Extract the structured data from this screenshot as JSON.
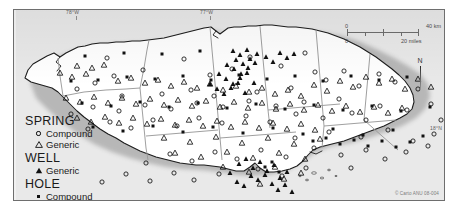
{
  "map": {
    "title": "Jamaica water-source place names",
    "background_color": "#e9e9e9",
    "frame_color": "#6e6e6e",
    "land_color": "#ffffff",
    "parish_border_color": "#8f8f8f",
    "coast_color": "#1a1a1a"
  },
  "graticule": {
    "longitude_labels": [
      {
        "text": "78°W",
        "x": 66,
        "y": 9
      },
      {
        "text": "77°W",
        "x": 200,
        "y": 9
      }
    ],
    "latitude_labels": [
      {
        "text": "18°N",
        "x": 433,
        "y": 124
      }
    ]
  },
  "legend": {
    "groups": [
      {
        "heading": "SPRING",
        "items": [
          {
            "symbol": "circle-open",
            "label": "Compound"
          },
          {
            "symbol": "triangle-open",
            "label": "Generic"
          }
        ]
      },
      {
        "heading": "WELL",
        "items": [
          {
            "symbol": "triangle-filled",
            "label": "Generic"
          }
        ]
      },
      {
        "heading": "HOLE",
        "items": [
          {
            "symbol": "square-filled",
            "label": "Compound"
          }
        ]
      }
    ]
  },
  "scalebar": {
    "km": {
      "zero": "0",
      "max": "40 km"
    },
    "miles": {
      "zero": "0",
      "max": "20 miles"
    }
  },
  "compass": {
    "north_label": "N"
  },
  "credit": {
    "text": "© Carto ANU 08-004"
  },
  "symbols": {
    "spring_compound": [
      [
        93,
        48
      ],
      [
        170,
        49
      ],
      [
        236,
        47
      ],
      [
        291,
        43
      ],
      [
        330,
        61
      ],
      [
        365,
        64
      ],
      [
        301,
        62
      ],
      [
        267,
        56
      ],
      [
        218,
        59
      ],
      [
        196,
        65
      ],
      [
        129,
        60
      ],
      [
        100,
        66
      ],
      [
        81,
        73
      ],
      [
        63,
        79
      ],
      [
        108,
        86
      ],
      [
        148,
        84
      ],
      [
        177,
        80
      ],
      [
        200,
        86
      ],
      [
        243,
        82
      ],
      [
        277,
        78
      ],
      [
        312,
        70
      ],
      [
        345,
        76
      ],
      [
        381,
        72
      ],
      [
        404,
        79
      ],
      [
        417,
        94
      ],
      [
        393,
        100
      ],
      [
        366,
        96
      ],
      [
        338,
        103
      ],
      [
        309,
        108
      ],
      [
        282,
        104
      ],
      [
        256,
        112
      ],
      [
        232,
        106
      ],
      [
        208,
        113
      ],
      [
        185,
        108
      ],
      [
        163,
        116
      ],
      [
        139,
        110
      ],
      [
        117,
        118
      ],
      [
        96,
        112
      ],
      [
        74,
        119
      ],
      [
        281,
        128
      ],
      [
        315,
        122
      ],
      [
        347,
        127
      ],
      [
        374,
        120
      ],
      [
        399,
        131
      ],
      [
        420,
        124
      ],
      [
        352,
        140
      ],
      [
        327,
        145
      ],
      [
        300,
        138
      ],
      [
        272,
        147
      ],
      [
        247,
        140
      ],
      [
        223,
        149
      ],
      [
        201,
        142
      ],
      [
        178,
        151
      ],
      [
        156,
        144
      ],
      [
        132,
        153
      ],
      [
        244,
        159
      ],
      [
        268,
        166
      ],
      [
        292,
        158
      ],
      [
        160,
        163
      ],
      [
        136,
        171
      ],
      [
        112,
        164
      ],
      [
        88,
        172
      ],
      [
        180,
        170
      ],
      [
        205,
        164
      ],
      [
        392,
        142
      ],
      [
        414,
        136
      ],
      [
        371,
        149
      ],
      [
        337,
        158
      ],
      [
        427,
        110
      ],
      [
        352,
        110
      ],
      [
        325,
        89
      ],
      [
        290,
        92
      ],
      [
        262,
        96
      ],
      [
        235,
        91
      ],
      [
        209,
        97
      ],
      [
        183,
        93
      ],
      [
        157,
        99
      ],
      [
        131,
        95
      ],
      [
        105,
        101
      ],
      [
        79,
        97
      ],
      [
        57,
        104
      ]
    ],
    "spring_generic": [
      [
        63,
        56
      ],
      [
        78,
        58
      ],
      [
        90,
        55
      ],
      [
        46,
        63
      ],
      [
        58,
        67
      ],
      [
        72,
        64
      ],
      [
        104,
        71
      ],
      [
        117,
        68
      ],
      [
        131,
        73
      ],
      [
        144,
        70
      ],
      [
        157,
        76
      ],
      [
        170,
        72
      ],
      [
        183,
        78
      ],
      [
        196,
        74
      ],
      [
        209,
        80
      ],
      [
        222,
        76
      ],
      [
        235,
        82
      ],
      [
        248,
        78
      ],
      [
        261,
        84
      ],
      [
        274,
        80
      ],
      [
        287,
        86
      ],
      [
        300,
        75
      ],
      [
        313,
        81
      ],
      [
        326,
        71
      ],
      [
        339,
        77
      ],
      [
        352,
        67
      ],
      [
        365,
        73
      ],
      [
        378,
        69
      ],
      [
        391,
        79
      ],
      [
        404,
        69
      ],
      [
        417,
        77
      ],
      [
        52,
        88
      ],
      [
        66,
        92
      ],
      [
        80,
        87
      ],
      [
        94,
        93
      ],
      [
        108,
        88
      ],
      [
        122,
        94
      ],
      [
        136,
        89
      ],
      [
        150,
        95
      ],
      [
        164,
        90
      ],
      [
        178,
        96
      ],
      [
        192,
        91
      ],
      [
        206,
        97
      ],
      [
        220,
        92
      ],
      [
        234,
        98
      ],
      [
        248,
        93
      ],
      [
        262,
        99
      ],
      [
        276,
        94
      ],
      [
        290,
        100
      ],
      [
        304,
        95
      ],
      [
        318,
        101
      ],
      [
        332,
        96
      ],
      [
        346,
        102
      ],
      [
        360,
        97
      ],
      [
        374,
        103
      ],
      [
        388,
        98
      ],
      [
        63,
        108
      ],
      [
        77,
        112
      ],
      [
        91,
        107
      ],
      [
        105,
        113
      ],
      [
        119,
        108
      ],
      [
        133,
        114
      ],
      [
        147,
        109
      ],
      [
        161,
        115
      ],
      [
        175,
        110
      ],
      [
        189,
        116
      ],
      [
        203,
        111
      ],
      [
        217,
        117
      ],
      [
        231,
        112
      ],
      [
        245,
        118
      ],
      [
        259,
        113
      ],
      [
        273,
        119
      ],
      [
        287,
        114
      ],
      [
        301,
        120
      ],
      [
        150,
        128
      ],
      [
        176,
        132
      ],
      [
        202,
        127
      ],
      [
        228,
        133
      ],
      [
        254,
        128
      ],
      [
        280,
        134
      ],
      [
        306,
        129
      ],
      [
        161,
        143
      ],
      [
        187,
        147
      ],
      [
        213,
        142
      ],
      [
        239,
        148
      ],
      [
        265,
        143
      ],
      [
        291,
        149
      ],
      [
        209,
        157
      ],
      [
        235,
        162
      ],
      [
        261,
        157
      ],
      [
        287,
        163
      ],
      [
        246,
        174
      ],
      [
        270,
        169
      ]
    ],
    "well_generic": [
      [
        219,
        41
      ],
      [
        226,
        45
      ],
      [
        233,
        40
      ],
      [
        222,
        50
      ],
      [
        229,
        54
      ],
      [
        236,
        49
      ],
      [
        243,
        44
      ],
      [
        213,
        55
      ],
      [
        220,
        59
      ],
      [
        227,
        64
      ],
      [
        234,
        58
      ],
      [
        241,
        53
      ],
      [
        205,
        64
      ],
      [
        212,
        69
      ],
      [
        219,
        74
      ],
      [
        226,
        68
      ],
      [
        233,
        63
      ],
      [
        240,
        73
      ],
      [
        196,
        74
      ],
      [
        203,
        79
      ],
      [
        210,
        84
      ],
      [
        217,
        78
      ],
      [
        224,
        73
      ],
      [
        231,
        83
      ],
      [
        252,
        47
      ],
      [
        259,
        52
      ],
      [
        266,
        43
      ],
      [
        273,
        48
      ],
      [
        280,
        44
      ],
      [
        225,
        154
      ],
      [
        232,
        149
      ],
      [
        239,
        158
      ],
      [
        246,
        152
      ],
      [
        253,
        161
      ],
      [
        260,
        155
      ],
      [
        237,
        166
      ],
      [
        244,
        170
      ],
      [
        251,
        165
      ],
      [
        258,
        174
      ],
      [
        266,
        168
      ],
      [
        273,
        162
      ],
      [
        216,
        163
      ],
      [
        223,
        172
      ],
      [
        230,
        176
      ],
      [
        264,
        180
      ],
      [
        271,
        175
      ],
      [
        278,
        182
      ]
    ],
    "hole_compound": [
      [
        71,
        46
      ],
      [
        110,
        43
      ],
      [
        148,
        44
      ],
      [
        186,
        41
      ],
      [
        57,
        71
      ],
      [
        84,
        70
      ],
      [
        113,
        67
      ],
      [
        141,
        69
      ],
      [
        169,
        66
      ],
      [
        197,
        70
      ],
      [
        225,
        65
      ],
      [
        253,
        69
      ],
      [
        281,
        66
      ],
      [
        309,
        71
      ],
      [
        337,
        66
      ],
      [
        365,
        70
      ],
      [
        393,
        67
      ],
      [
        68,
        93
      ],
      [
        97,
        96
      ],
      [
        126,
        92
      ],
      [
        155,
        97
      ],
      [
        184,
        93
      ],
      [
        213,
        98
      ],
      [
        242,
        94
      ],
      [
        271,
        99
      ],
      [
        300,
        95
      ],
      [
        329,
        100
      ],
      [
        358,
        96
      ],
      [
        387,
        101
      ],
      [
        416,
        97
      ],
      [
        79,
        117
      ],
      [
        109,
        121
      ],
      [
        139,
        116
      ],
      [
        169,
        122
      ],
      [
        199,
        117
      ],
      [
        229,
        123
      ],
      [
        259,
        118
      ],
      [
        289,
        124
      ],
      [
        319,
        119
      ],
      [
        349,
        125
      ],
      [
        379,
        120
      ],
      [
        409,
        126
      ],
      [
        299,
        131
      ],
      [
        312,
        128
      ],
      [
        326,
        134
      ],
      [
        340,
        130
      ],
      [
        354,
        136
      ],
      [
        368,
        131
      ],
      [
        382,
        137
      ],
      [
        396,
        132
      ],
      [
        251,
        157
      ],
      [
        258,
        152
      ],
      [
        265,
        162
      ]
    ]
  }
}
